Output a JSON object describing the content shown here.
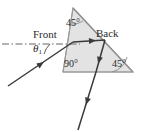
{
  "figure": {
    "canvas": {
      "width": 144,
      "height": 132,
      "background": "#ffffff"
    },
    "prism": {
      "name": "right-triangle-prism",
      "fill": "#e3e3e3",
      "stroke": "#8a8a8a",
      "vertices": {
        "apex": {
          "x": 73,
          "y": 8
        },
        "bottom_left": {
          "x": 63,
          "y": 72
        },
        "bottom_right": {
          "x": 133,
          "y": 72
        }
      }
    },
    "labels": {
      "front": "Front",
      "back": "Back",
      "theta": "θ",
      "theta_subscript": "1",
      "apex_angle": "45°",
      "right_angle": "90°",
      "base_angle": "45°"
    },
    "rays": {
      "stroke": "#3a3a3a",
      "incident": {
        "name": "incident-ray",
        "from": {
          "x": 8,
          "y": 86
        },
        "to": {
          "x": 73,
          "y": 42
        }
      },
      "internal_to_back": {
        "name": "internal-ray-to-back-face",
        "from": {
          "x": 73,
          "y": 42
        },
        "to": {
          "x": 104,
          "y": 41
        }
      },
      "internal_down": {
        "name": "internal-ray-reflected-down",
        "from": {
          "x": 104,
          "y": 41
        },
        "to": {
          "x": 96,
          "y": 72
        }
      },
      "exit": {
        "name": "exit-ray",
        "from": {
          "x": 96,
          "y": 72
        },
        "to": {
          "x": 78,
          "y": 130
        }
      }
    },
    "normal_line": {
      "name": "surface-normal-dash-dot",
      "stroke": "#555555",
      "from": {
        "x": 2,
        "y": 44
      },
      "to": {
        "x": 80,
        "y": 44
      },
      "style": "dash-dot"
    }
  }
}
